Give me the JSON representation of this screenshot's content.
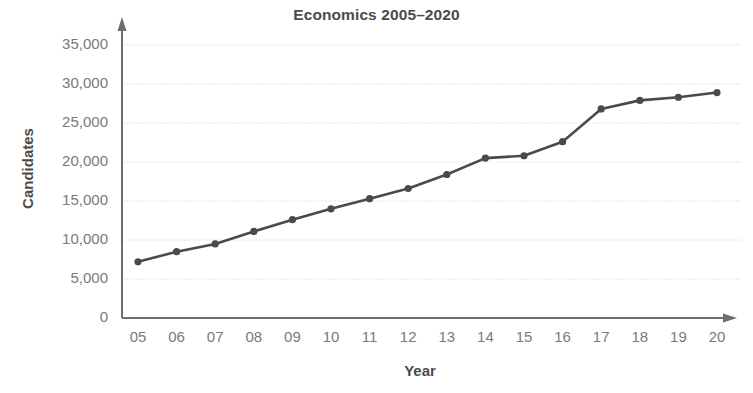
{
  "chart_data": {
    "type": "line",
    "title": "Economics 2005–2020",
    "xlabel": "Year",
    "ylabel": "Candidates",
    "categories": [
      "05",
      "06",
      "07",
      "08",
      "09",
      "10",
      "11",
      "12",
      "13",
      "14",
      "15",
      "16",
      "17",
      "18",
      "19",
      "20"
    ],
    "values": [
      7200,
      8500,
      9500,
      11100,
      12600,
      14000,
      15300,
      16600,
      18400,
      20500,
      20800,
      22600,
      26800,
      27900,
      28300,
      28900
    ],
    "ylim": [
      0,
      35000
    ],
    "ytick_labels": [
      "0",
      "5,000",
      "10,000",
      "15,000",
      "20,000",
      "25,000",
      "30,000",
      "35,000"
    ],
    "ytick_values": [
      0,
      5000,
      10000,
      15000,
      20000,
      25000,
      30000,
      35000
    ],
    "grid": true,
    "legend": false,
    "series_color": "#4a4a4a",
    "grid_color": "#dcdcdc",
    "axis_color": "#6e6e6e",
    "tick_label_color": "#7a7a7a",
    "title_color": "#4b4b4b"
  }
}
